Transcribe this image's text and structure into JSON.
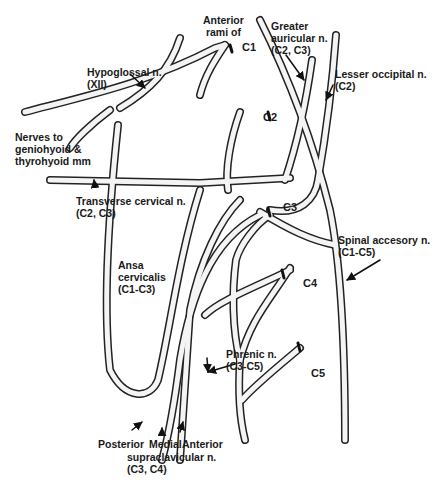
{
  "diagram": {
    "labels": {
      "anterior_rami": "Anterior\nrami of",
      "c1": "C1",
      "c2": "C2",
      "c3": "C3",
      "c4": "C4",
      "c5": "C5",
      "hypoglossal": "Hypoglossal n.\n(XII)",
      "greater_auricular": "Greater\nauricular n.\n(C2, C3)",
      "lesser_occipital": "Lesser occipital n.\n(C2)",
      "nerves_to_geniohyoid": "Nerves to\ngeniohyoid &\nthyrohyoid mm",
      "transverse_cervical": "Transverse cervical n.\n(C2, C3)",
      "spinal_accessory": "Spinal accesory n.\n(C1-C5)",
      "ansa_cervicalis": "Ansa\ncervicalis\n(C1-C3)",
      "phrenic": "Phrenic n.\n(C3-C5)",
      "posterior": "Posterior",
      "medial": "Medial",
      "anterior": "Anterior",
      "supraclavicular": "supraclavicular n.\n(C3, C4)"
    },
    "colors": {
      "nerve_stroke": "#222222",
      "nerve_fill": "#f4f4f4",
      "text": "#1a1a1a"
    }
  }
}
